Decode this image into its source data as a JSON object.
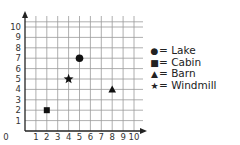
{
  "chart_data": {
    "type": "scatter",
    "title": "",
    "xlabel": "",
    "ylabel": "",
    "xlim": [
      0,
      10
    ],
    "ylim": [
      0,
      10
    ],
    "grid": true,
    "x_ticks": [
      "0",
      "1",
      "2",
      "3",
      "4",
      "5",
      "6",
      "7",
      "8",
      "9",
      "10"
    ],
    "y_ticks": [
      "1",
      "2",
      "3",
      "4",
      "5",
      "6",
      "7",
      "8",
      "9",
      "10"
    ],
    "legend_position": "right",
    "series": [
      {
        "name": "Lake",
        "marker": "circle",
        "x": 5,
        "y": 7
      },
      {
        "name": "Cabin",
        "marker": "square",
        "x": 2,
        "y": 2
      },
      {
        "name": "Barn",
        "marker": "triangle",
        "x": 8,
        "y": 4
      },
      {
        "name": "Windmill",
        "marker": "star",
        "x": 4,
        "y": 5
      }
    ]
  },
  "legend": [
    {
      "symbol": "●",
      "label": "= Lake"
    },
    {
      "symbol": "■",
      "label": "= Cabin"
    },
    {
      "symbol": "▲",
      "label": "= Barn"
    },
    {
      "symbol": "★",
      "label": "= Windmill"
    }
  ],
  "colors": {
    "grid": "#9a9a9a",
    "axis": "#222222",
    "marker": "#111111"
  }
}
